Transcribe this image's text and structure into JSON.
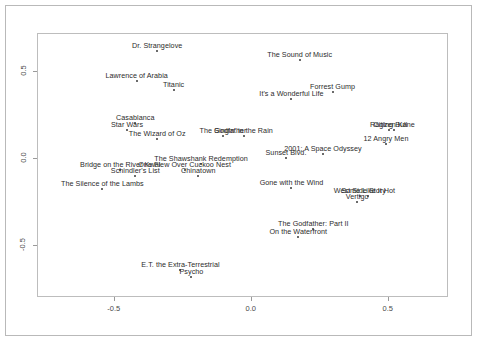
{
  "chart_data": {
    "type": "scatter",
    "title": "",
    "subtitle": "",
    "xlabel": "",
    "ylabel": "",
    "xlim": [
      -0.78,
      0.72
    ],
    "ylim": [
      -0.8,
      0.72
    ],
    "xticks": [
      -0.5,
      0.0,
      0.5
    ],
    "xticklabels": [
      "-0.5",
      "0.0",
      "0.5"
    ],
    "yticks": [
      -0.5,
      0.0,
      0.5
    ],
    "yticklabels": [
      "-0.5",
      "0.0",
      "0.5"
    ],
    "grid": false,
    "legend": "none",
    "point_color": "#3a3a3a",
    "label_color": "#2b2b2b",
    "frame_color": "#bdbdbd",
    "points": [
      {
        "label": "Dr. Strangelove",
        "x": -0.345,
        "y": 0.625
      },
      {
        "label": "The Sound of Music",
        "x": 0.175,
        "y": 0.57
      },
      {
        "label": "Lawrence of Arabia",
        "x": -0.42,
        "y": 0.45
      },
      {
        "label": "Titanic",
        "x": -0.285,
        "y": 0.4
      },
      {
        "label": "Forrest Gump",
        "x": 0.295,
        "y": 0.385
      },
      {
        "label": "It's a Wonderful Life",
        "x": 0.145,
        "y": 0.345
      },
      {
        "label": "Casablanca",
        "x": -0.425,
        "y": 0.205
      },
      {
        "label": "Star Wars",
        "x": -0.455,
        "y": 0.17
      },
      {
        "label": "Raging Bull",
        "x": 0.5,
        "y": 0.17
      },
      {
        "label": "Citizen Kane",
        "x": 0.52,
        "y": 0.17
      },
      {
        "label": "The Godfather",
        "x": -0.105,
        "y": 0.135
      },
      {
        "label": "Singin' in the Rain",
        "x": -0.03,
        "y": 0.135
      },
      {
        "label": "The Wizard of Oz",
        "x": -0.345,
        "y": 0.115
      },
      {
        "label": "12 Angry Men",
        "x": 0.49,
        "y": 0.085
      },
      {
        "label": "2001: A Space Odyssey",
        "x": 0.26,
        "y": 0.03
      },
      {
        "label": "Sunset Blvd.",
        "x": 0.125,
        "y": 0.005
      },
      {
        "label": "The Shawshank Redemption",
        "x": -0.185,
        "y": -0.03
      },
      {
        "label": "One Flew Over Cuckoo Nest",
        "x": -0.245,
        "y": -0.065
      },
      {
        "label": "Bridge on the River Kwai",
        "x": -0.48,
        "y": -0.065
      },
      {
        "label": "Schindler's List",
        "x": -0.425,
        "y": -0.1
      },
      {
        "label": "Chinatown",
        "x": -0.195,
        "y": -0.1
      },
      {
        "label": "Gone with the Wind",
        "x": 0.145,
        "y": -0.165
      },
      {
        "label": "The Silence of the Lambs",
        "x": -0.545,
        "y": -0.17
      },
      {
        "label": "West Side Story",
        "x": 0.395,
        "y": -0.215
      },
      {
        "label": "Some Like It Hot",
        "x": 0.425,
        "y": -0.215
      },
      {
        "label": "Vertigo",
        "x": 0.385,
        "y": -0.25
      },
      {
        "label": "The Godfather: Part II",
        "x": 0.225,
        "y": -0.4
      },
      {
        "label": "On the Waterfront",
        "x": 0.17,
        "y": -0.45
      },
      {
        "label": "E.T. the Extra-Terrestrial",
        "x": -0.26,
        "y": -0.64
      },
      {
        "label": "Psycho",
        "x": -0.22,
        "y": -0.68
      }
    ]
  }
}
